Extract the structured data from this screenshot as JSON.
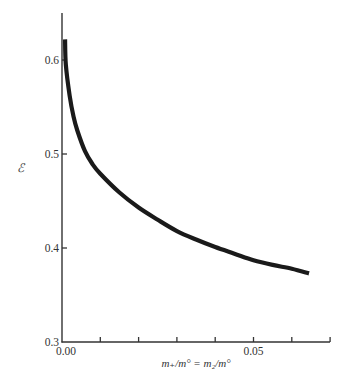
{
  "chart_data": {
    "type": "line",
    "title": "",
    "xlabel": "m₊/m° = m₂/m°",
    "ylabel": "ℰ",
    "xlim": [
      0.0,
      0.067
    ],
    "ylim": [
      0.3,
      0.65
    ],
    "grid": false,
    "legend": null,
    "x_ticks": [
      0.0,
      0.01,
      0.02,
      0.03,
      0.04,
      0.05,
      0.06,
      0.07
    ],
    "x_tick_labels": [
      {
        "value": 0.0,
        "label": "0.00"
      },
      {
        "value": 0.05,
        "label": "0.05"
      }
    ],
    "y_ticks": [
      0.3,
      0.4,
      0.5,
      0.6
    ],
    "y_tick_labels": [
      {
        "value": 0.3,
        "label": "0.3"
      },
      {
        "value": 0.4,
        "label": "0.4"
      },
      {
        "value": 0.5,
        "label": "0.5"
      },
      {
        "value": 0.6,
        "label": "0.6"
      }
    ],
    "series": [
      {
        "name": "ℰ",
        "color": "#1a1a1a",
        "x": [
          0.0008,
          0.001,
          0.002,
          0.003,
          0.004,
          0.006,
          0.008,
          0.01,
          0.015,
          0.02,
          0.025,
          0.03,
          0.035,
          0.04,
          0.045,
          0.05,
          0.055,
          0.06,
          0.0645
        ],
        "y": [
          0.622,
          0.595,
          0.562,
          0.54,
          0.525,
          0.503,
          0.489,
          0.479,
          0.459,
          0.443,
          0.43,
          0.418,
          0.409,
          0.401,
          0.394,
          0.387,
          0.382,
          0.378,
          0.373
        ]
      }
    ]
  }
}
